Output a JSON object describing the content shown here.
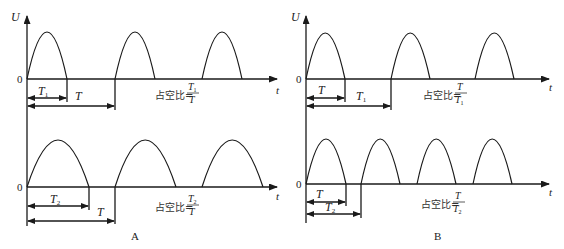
{
  "panels": [
    {
      "id": "A",
      "label": "A",
      "top": {
        "y_axis_label": "U",
        "x_axis_label": "t",
        "origin_label": "0",
        "short_interval": {
          "main": "T",
          "sub": "1"
        },
        "long_interval": {
          "main": "T",
          "sub": ""
        },
        "duty_formula": {
          "prefix": "占空比=",
          "num_main": "T",
          "num_sub": "1",
          "den_main": "T",
          "den_sub": ""
        }
      },
      "bottom": {
        "x_axis_label": "t",
        "origin_label": "0",
        "short_interval": {
          "main": "T",
          "sub": "2"
        },
        "long_interval": {
          "main": "T",
          "sub": ""
        },
        "duty_formula": {
          "prefix": "占空比=",
          "num_main": "T",
          "num_sub": "2",
          "den_main": "T",
          "den_sub": ""
        }
      }
    },
    {
      "id": "B",
      "label": "B",
      "top": {
        "y_axis_label": "U",
        "x_axis_label": "t",
        "origin_label": "0",
        "short_interval": {
          "main": "T",
          "sub": ""
        },
        "long_interval": {
          "main": "T",
          "sub": "1"
        },
        "duty_formula": {
          "prefix": "占空比=",
          "num_main": "T",
          "num_sub": "",
          "den_main": "T",
          "den_sub": "1"
        }
      },
      "bottom": {
        "x_axis_label": "t",
        "origin_label": "0",
        "short_interval": {
          "main": "T",
          "sub": ""
        },
        "long_interval": {
          "main": "T",
          "sub": "2"
        },
        "duty_formula": {
          "prefix": "占空比=",
          "num_main": "T",
          "num_sub": "",
          "den_main": "T",
          "den_sub": "2"
        }
      }
    }
  ]
}
